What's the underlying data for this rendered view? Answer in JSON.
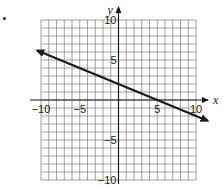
{
  "problem": {
    "bullet": "•"
  },
  "chart_data": {
    "type": "line",
    "title": "",
    "xlabel": "x",
    "ylabel": "y",
    "xlim": [
      -10,
      10
    ],
    "ylim": [
      -10,
      10
    ],
    "grid": true,
    "grid_step": 1,
    "x_ticks": [
      -10,
      -5,
      5,
      10
    ],
    "y_ticks": [
      10,
      5,
      -5,
      -10
    ],
    "x_tick_labels": [
      "−10",
      "−5",
      "5",
      "10"
    ],
    "y_tick_labels": [
      "10",
      "5",
      "−5",
      "−10"
    ],
    "series": [
      {
        "name": "line",
        "equation": "y = -0.4x + 2",
        "slope": -0.4,
        "intercept": 2,
        "x": [
          -10.5,
          0,
          5,
          11.5
        ],
        "y": [
          6.2,
          2,
          0,
          -2.6
        ],
        "arrows": "both",
        "color": "#1a1a1a"
      }
    ],
    "legend": "none"
  },
  "colors": {
    "grid": "#8a8a8a",
    "axis": "#1a1a1a",
    "text": "#222222",
    "background": "#ffffff"
  }
}
